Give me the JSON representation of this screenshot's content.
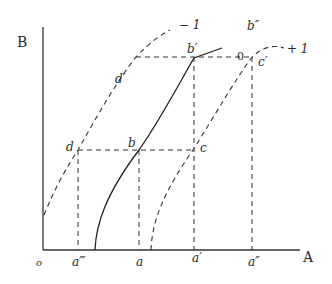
{
  "diagram": {
    "axes": {
      "x_label": "A",
      "y_label": "B",
      "origin_label": "o"
    },
    "curves": [
      {
        "id": "curve-0",
        "label": "0",
        "style": "solid"
      },
      {
        "id": "curve-minus-1",
        "label": "− 1",
        "style": "dashed"
      },
      {
        "id": "curve-plus-1",
        "label": "+ 1",
        "style": "dashed"
      }
    ],
    "points": {
      "b": "b",
      "b_prime": "b′",
      "b_double": "b″",
      "c": "c",
      "c_prime": "c′",
      "d": "d",
      "d_prime": "d′"
    },
    "x_ticks": {
      "a_triple": "a‴",
      "a": "a",
      "a_prime": "a′",
      "a_double": "a″"
    }
  }
}
